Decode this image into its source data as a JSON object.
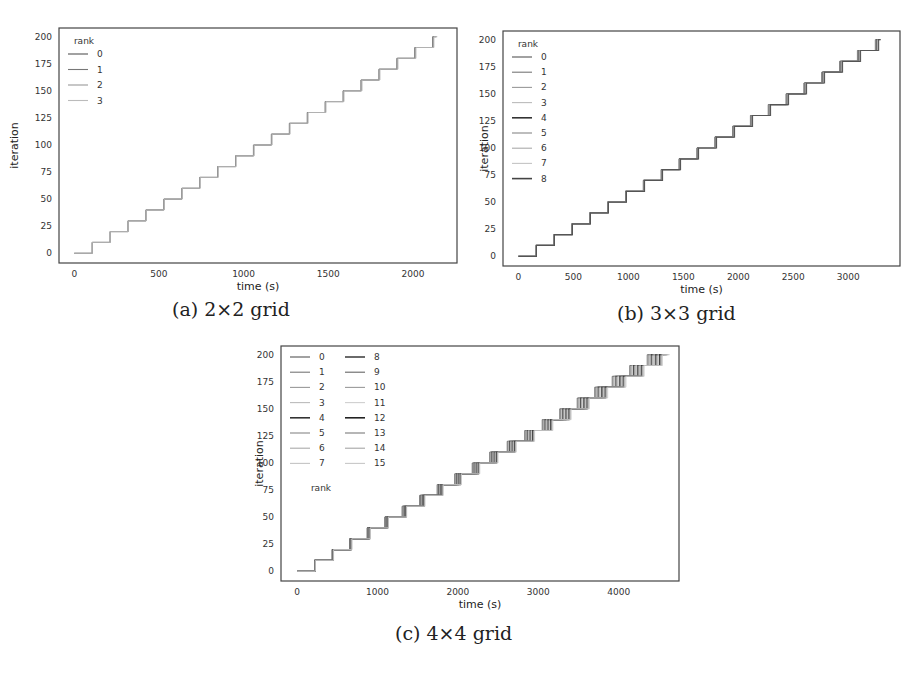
{
  "figure": {
    "captions": [
      "(a) 2×2 grid",
      "(b) 3×3 grid",
      "(c) 4×4 grid"
    ]
  },
  "chart_data": [
    {
      "type": "line",
      "id": "a",
      "caption": "(a) 2×2 grid",
      "title": "",
      "xlabel": "time (s)",
      "ylabel": "iteration",
      "xlim": [
        -90,
        2260
      ],
      "ylim": [
        -9,
        208
      ],
      "xticks": [
        0,
        500,
        1000,
        1500,
        2000
      ],
      "yticks": [
        0,
        25,
        50,
        75,
        100,
        125,
        150,
        175,
        200
      ],
      "grid": false,
      "legend": {
        "title": "rank",
        "position": "upper left",
        "columns": 1,
        "entries": [
          "0",
          "1",
          "2",
          "3"
        ]
      },
      "step_iterations": 10,
      "max_iteration": 200,
      "step_duration_s": 105,
      "end_time_s": 2120,
      "rank_spread_s": 8,
      "series_note": "All ranks follow a near-identical staircase: iteration increases by 10 roughly every 105 s, reaching ~200 at ~2120 s",
      "series": [
        {
          "name": "0",
          "x": [
            0,
            105,
            210,
            315,
            420,
            525,
            630,
            735,
            840,
            945,
            1050,
            1155,
            1260,
            1365,
            1470,
            1575,
            1680,
            1785,
            1890,
            2000,
            2110
          ],
          "y": [
            0,
            10,
            20,
            30,
            40,
            50,
            60,
            70,
            80,
            90,
            100,
            110,
            120,
            130,
            140,
            150,
            160,
            170,
            180,
            190,
            200
          ]
        },
        {
          "name": "1",
          "x": [
            0,
            106,
            212,
            318,
            424,
            530,
            636,
            742,
            848,
            954,
            1060,
            1166,
            1272,
            1378,
            1484,
            1590,
            1696,
            1802,
            1908,
            2014,
            2120
          ],
          "y": [
            0,
            10,
            20,
            30,
            40,
            50,
            60,
            70,
            80,
            90,
            100,
            110,
            120,
            130,
            140,
            150,
            160,
            170,
            180,
            190,
            200
          ]
        },
        {
          "name": "2",
          "x": [
            0,
            104,
            209,
            313,
            418,
            522,
            627,
            731,
            836,
            940,
            1045,
            1149,
            1254,
            1358,
            1463,
            1567,
            1672,
            1776,
            1881,
            1985,
            2095
          ],
          "y": [
            0,
            10,
            20,
            30,
            40,
            50,
            60,
            70,
            80,
            90,
            100,
            110,
            120,
            130,
            140,
            150,
            160,
            170,
            180,
            190,
            200
          ]
        },
        {
          "name": "3",
          "x": [
            0,
            105,
            211,
            316,
            422,
            527,
            633,
            738,
            844,
            949,
            1055,
            1160,
            1266,
            1371,
            1477,
            1582,
            1688,
            1793,
            1899,
            2004,
            2115
          ],
          "y": [
            0,
            10,
            20,
            30,
            40,
            50,
            60,
            70,
            80,
            90,
            100,
            110,
            120,
            130,
            140,
            150,
            160,
            170,
            180,
            190,
            200
          ]
        }
      ]
    },
    {
      "type": "line",
      "id": "b",
      "caption": "(b) 3×3 grid",
      "title": "",
      "xlabel": "time (s)",
      "ylabel": "iteration",
      "xlim": [
        -140,
        3470
      ],
      "ylim": [
        -9,
        208
      ],
      "xticks": [
        0,
        500,
        1000,
        1500,
        2000,
        2500,
        3000
      ],
      "yticks": [
        0,
        25,
        50,
        75,
        100,
        125,
        150,
        175,
        200
      ],
      "grid": false,
      "legend": {
        "title": "rank",
        "position": "upper left",
        "columns": 1,
        "entries": [
          "0",
          "1",
          "2",
          "3",
          "4",
          "5",
          "6",
          "7",
          "8"
        ]
      },
      "step_iterations": 10,
      "max_iteration": 200,
      "step_duration_s": 163,
      "end_time_s": 3260,
      "rank_spread_s": 30,
      "series_note": "9 ranks follow overlapping staircases: +10 iterations every ~163 s, reaching ~200 at ~3260 s; spread between ranks grows slightly with time",
      "series": [
        {
          "name": "0",
          "x": [
            0,
            160,
            322,
            484,
            646,
            808,
            970,
            1132,
            1294,
            1456,
            1618,
            1780,
            1942,
            2104,
            2266,
            2428,
            2590,
            2752,
            2914,
            3076,
            3238
          ],
          "y": [
            0,
            10,
            20,
            30,
            40,
            50,
            60,
            70,
            80,
            90,
            100,
            110,
            120,
            130,
            140,
            150,
            160,
            170,
            180,
            190,
            200
          ]
        },
        {
          "name": "4",
          "x": [
            0,
            163,
            326,
            489,
            652,
            815,
            978,
            1141,
            1304,
            1467,
            1630,
            1793,
            1956,
            2119,
            2282,
            2445,
            2608,
            2771,
            2934,
            3097,
            3260
          ],
          "y": [
            0,
            10,
            20,
            30,
            40,
            50,
            60,
            70,
            80,
            90,
            100,
            110,
            120,
            130,
            140,
            150,
            160,
            170,
            180,
            190,
            200
          ]
        },
        {
          "name": "8",
          "x": [
            0,
            165,
            330,
            495,
            660,
            825,
            990,
            1155,
            1320,
            1485,
            1650,
            1815,
            1980,
            2145,
            2310,
            2475,
            2640,
            2805,
            2970,
            3135,
            3275
          ],
          "y": [
            0,
            10,
            20,
            30,
            40,
            50,
            60,
            70,
            80,
            90,
            100,
            110,
            120,
            130,
            140,
            150,
            160,
            170,
            180,
            190,
            200
          ]
        }
      ]
    },
    {
      "type": "line",
      "id": "c",
      "caption": "(c) 4×4 grid",
      "title": "",
      "xlabel": "time (s)",
      "ylabel": "iteration",
      "xlim": [
        -200,
        4750
      ],
      "ylim": [
        -9,
        208
      ],
      "xticks": [
        0,
        1000,
        2000,
        3000,
        4000
      ],
      "yticks": [
        0,
        25,
        50,
        75,
        100,
        125,
        150,
        175,
        200
      ],
      "grid": false,
      "legend": {
        "title": "rank",
        "title_position": "below",
        "position": "upper left",
        "columns": 2,
        "entries": [
          "0",
          "1",
          "2",
          "3",
          "4",
          "5",
          "6",
          "7",
          "8",
          "9",
          "10",
          "11",
          "12",
          "13",
          "14",
          "15"
        ]
      },
      "step_iterations": 10,
      "max_iteration": 200,
      "step_duration_s": 218,
      "end_time_s": 4450,
      "rank_spread_s": 190,
      "series_note": "16 ranks follow staircases with +10 iterations every ~218 s, reaching ~200 between ~4300 and ~4480 s; spread between ranks widens to ~190 s near the end",
      "series": [
        {
          "name": "0",
          "x": [
            0,
            200,
            418,
            636,
            854,
            1072,
            1290,
            1508,
            1726,
            1944,
            2162,
            2380,
            2598,
            2816,
            3034,
            3252,
            3470,
            3688,
            3906,
            4124,
            4300
          ],
          "y": [
            0,
            10,
            20,
            30,
            40,
            50,
            60,
            70,
            80,
            90,
            100,
            110,
            120,
            130,
            140,
            150,
            160,
            170,
            180,
            190,
            200
          ]
        },
        {
          "name": "15",
          "x": [
            0,
            210,
            432,
            654,
            876,
            1098,
            1320,
            1542,
            1764,
            1986,
            2208,
            2430,
            2652,
            2874,
            3096,
            3318,
            3540,
            3762,
            3984,
            4206,
            4470
          ],
          "y": [
            0,
            10,
            20,
            30,
            40,
            50,
            60,
            70,
            80,
            90,
            100,
            110,
            120,
            130,
            140,
            150,
            160,
            170,
            180,
            190,
            200
          ]
        }
      ]
    }
  ]
}
